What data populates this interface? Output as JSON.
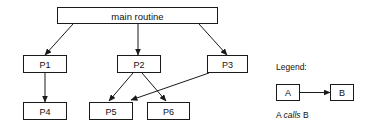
{
  "diagram": {
    "colors": {
      "stroke": "#1a1a1a",
      "fill": "#ffffff",
      "text": "#111111",
      "background": "#ffffff"
    },
    "nodes": {
      "main": {
        "label": "main routine",
        "x": 57,
        "y": 7,
        "w": 161,
        "h": 17
      },
      "p1": {
        "label": "P1",
        "x": 23,
        "y": 55,
        "w": 44,
        "h": 18
      },
      "p2": {
        "label": "P2",
        "x": 117,
        "y": 55,
        "w": 44,
        "h": 18
      },
      "p3": {
        "label": "P3",
        "x": 207,
        "y": 55,
        "w": 41,
        "h": 18
      },
      "p4": {
        "label": "P4",
        "x": 23,
        "y": 102,
        "w": 44,
        "h": 18
      },
      "p5": {
        "label": "P5",
        "x": 89,
        "y": 102,
        "w": 44,
        "h": 18
      },
      "p6": {
        "label": "P6",
        "x": 147,
        "y": 102,
        "w": 43,
        "h": 18
      }
    },
    "edges": [
      {
        "name": "main-to-p1",
        "from": "main",
        "to": "p1",
        "x1": 73,
        "y1": 24,
        "x2": 45,
        "y2": 55
      },
      {
        "name": "main-to-p2",
        "from": "main",
        "to": "p2",
        "x1": 138,
        "y1": 24,
        "x2": 138,
        "y2": 55
      },
      {
        "name": "main-to-p3",
        "from": "main",
        "to": "p3",
        "x1": 199,
        "y1": 24,
        "x2": 227,
        "y2": 55
      },
      {
        "name": "p1-to-p4",
        "from": "p1",
        "to": "p4",
        "x1": 45,
        "y1": 73,
        "x2": 45,
        "y2": 102
      },
      {
        "name": "p2-to-p5",
        "from": "p2",
        "to": "p5",
        "x1": 133,
        "y1": 73,
        "x2": 109,
        "y2": 101
      },
      {
        "name": "p2-to-p6",
        "from": "p2",
        "to": "p6",
        "x1": 142,
        "y1": 73,
        "x2": 166,
        "y2": 101
      },
      {
        "name": "p3-to-p5",
        "from": "p3",
        "to": "p5",
        "x1": 209,
        "y1": 73,
        "x2": 131,
        "y2": 100
      }
    ]
  },
  "legend": {
    "title": "Legend:",
    "title_x": 276,
    "title_y": 67,
    "box_a": {
      "label": "A",
      "x": 276,
      "y": 84,
      "w": 24,
      "h": 17
    },
    "box_b": {
      "label": "B",
      "x": 330,
      "y": 84,
      "w": 24,
      "h": 17
    },
    "arrow": {
      "x1": 300,
      "y1": 92,
      "x2": 329,
      "y2": 92
    },
    "caption_prefix": "A ",
    "caption_emphasis": "calls",
    "caption_suffix": " B",
    "caption_x": 276,
    "caption_y": 115
  }
}
